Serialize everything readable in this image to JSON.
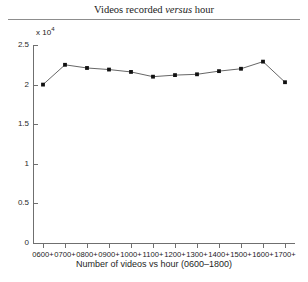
{
  "chart_data": {
    "type": "line",
    "title": "Videos recorded versus hour",
    "title_plain": "Videos recorded ",
    "title_italic": "versus",
    "title_tail": " hour",
    "xlabel": "Number of videos vs hour (0600–1800)",
    "ylabel": "",
    "y_exponent_prefix": "x 10",
    "y_exponent": "4",
    "y_scale": 10000,
    "categories": [
      "0600+",
      "0700+",
      "0800+",
      "0900+",
      "1000+",
      "1100+",
      "1200+",
      "1300+",
      "1400+",
      "1500+",
      "1600+",
      "1700+"
    ],
    "values": [
      20000,
      22500,
      22100,
      21900,
      21600,
      21000,
      21200,
      21300,
      21700,
      22000,
      22900,
      20300
    ],
    "values_scaled": [
      2.0,
      2.25,
      2.21,
      2.19,
      2.16,
      2.1,
      2.12,
      2.13,
      2.17,
      2.2,
      2.29,
      2.03
    ],
    "ylim": [
      0,
      2.5
    ],
    "yticks": [
      0,
      0.5,
      1,
      1.5,
      2,
      2.5
    ],
    "ytick_labels": [
      "0",
      "0.5",
      "1",
      "1.5",
      "2",
      "2.5"
    ],
    "grid": false,
    "legend": null,
    "marker": "filled-square",
    "line_color": "#555555",
    "marker_color": "#111111"
  }
}
